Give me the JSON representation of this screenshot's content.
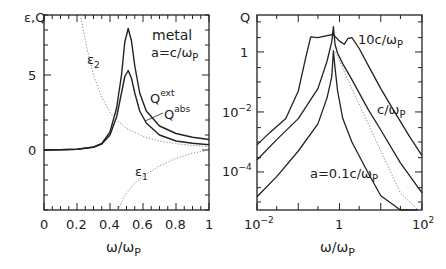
{
  "chart_data": [
    {
      "type": "line",
      "panel": "left",
      "ylabel": "ε,Q",
      "xlabel": "ω/ωP",
      "xlim": [
        0,
        1
      ],
      "ylim": [
        -4,
        9
      ],
      "xticks": [
        "0",
        "0.2",
        "0.4",
        "0.6",
        "0.8",
        "1"
      ],
      "yticks": [
        "0",
        "5"
      ],
      "annotations": [
        "metal",
        "a=c/ωP",
        "ε2",
        "ε1",
        "Qext",
        "Qabs"
      ],
      "series": [
        {
          "name": "Qext",
          "style": "solid",
          "x": [
            0,
            0.1,
            0.2,
            0.3,
            0.35,
            0.4,
            0.44,
            0.47,
            0.49,
            0.51,
            0.53,
            0.55,
            0.58,
            0.62,
            0.7,
            0.8,
            0.9,
            1.0
          ],
          "values": [
            0,
            0.01,
            0.05,
            0.2,
            0.45,
            1.2,
            2.8,
            5.0,
            7.2,
            8.1,
            7.3,
            5.6,
            3.8,
            2.6,
            1.6,
            1.1,
            0.85,
            0.7
          ]
        },
        {
          "name": "Qabs",
          "style": "solid",
          "x": [
            0,
            0.1,
            0.2,
            0.3,
            0.35,
            0.4,
            0.44,
            0.47,
            0.49,
            0.51,
            0.53,
            0.55,
            0.58,
            0.62,
            0.7,
            0.8,
            0.9,
            1.0
          ],
          "values": [
            0,
            0.01,
            0.05,
            0.18,
            0.4,
            1.0,
            2.2,
            3.8,
            4.9,
            5.3,
            4.8,
            3.8,
            2.6,
            1.8,
            1.0,
            0.6,
            0.45,
            0.35
          ]
        },
        {
          "name": "ε2",
          "style": "dotted",
          "x": [
            0.22,
            0.26,
            0.3,
            0.35,
            0.4,
            0.45,
            0.5,
            0.6,
            0.7,
            0.8,
            0.9,
            1.0
          ],
          "values": [
            9,
            6.8,
            5.0,
            3.5,
            2.5,
            1.9,
            1.45,
            0.9,
            0.6,
            0.42,
            0.3,
            0.22
          ]
        },
        {
          "name": "ε1",
          "style": "dotted",
          "x": [
            0.45,
            0.48,
            0.5,
            0.55,
            0.6,
            0.7,
            0.8,
            0.9,
            1.0
          ],
          "values": [
            -4,
            -3.2,
            -2.9,
            -2.2,
            -1.75,
            -1.05,
            -0.55,
            -0.22,
            0
          ]
        }
      ]
    },
    {
      "type": "line",
      "panel": "right",
      "ylabel": "Q",
      "xlabel": "ω/ωP",
      "xscale": "log",
      "yscale": "log",
      "xlim": [
        0.01,
        100
      ],
      "ylim": [
        5.4e-06,
        17
      ],
      "xticks": [
        "10^-2",
        "1",
        "10^2"
      ],
      "yticks": [
        "10^-4",
        "10^-2",
        "1"
      ],
      "annotations": [
        "10c/ωP",
        "c/ωP",
        "a=0.1c/ωP"
      ],
      "series": [
        {
          "name": "10c/ωP",
          "style": "solid",
          "x": [
            0.01,
            0.02,
            0.05,
            0.1,
            0.15,
            0.2,
            0.3,
            0.5,
            0.7,
            1.0,
            1.3,
            1.6,
            2.0,
            3,
            5,
            10,
            20,
            50,
            100
          ],
          "values": [
            0.0008,
            0.002,
            0.006,
            0.05,
            0.6,
            3.2,
            3.0,
            3.5,
            3.8,
            2.3,
            1.8,
            2.8,
            3.0,
            1.3,
            0.35,
            0.06,
            0.012,
            0.0015,
            0.00035
          ]
        },
        {
          "name": "c/ωP",
          "style": "solid",
          "x": [
            0.01,
            0.03,
            0.1,
            0.3,
            0.5,
            0.65,
            0.71,
            0.78,
            0.9,
            1.2,
            2,
            5,
            10,
            30,
            100
          ],
          "values": [
            0.00025,
            0.0012,
            0.006,
            0.06,
            0.5,
            2.2,
            7,
            1.8,
            0.9,
            0.4,
            0.12,
            0.012,
            0.0025,
            0.0002,
            2e-05
          ]
        },
        {
          "name": "a=0.1c/ωP",
          "style": "solid",
          "x": [
            0.01,
            0.03,
            0.1,
            0.3,
            0.5,
            0.65,
            0.71,
            0.78,
            0.9,
            1.2,
            2,
            5,
            10,
            30,
            80
          ],
          "values": [
            1.5e-05,
            7e-05,
            0.0005,
            0.004,
            0.03,
            0.15,
            1.1,
            0.3,
            0.05,
            0.006,
            0.001,
            9e-05,
            1.6e-05,
            1.5e-06,
            5.5e-06
          ]
        },
        {
          "name": "dotted",
          "style": "dotted",
          "x": [
            0.8,
            1,
            2,
            5,
            10,
            30,
            80
          ],
          "values": [
            1.0,
            0.5,
            0.06,
            0.004,
            0.0005,
            2e-05,
            5.5e-06
          ]
        }
      ]
    }
  ],
  "left": {
    "ylabel_text": "ε,Q",
    "xlabel_text": "ω/ω",
    "xlabel_sub": "P",
    "ytick_labels": [
      "5",
      "0"
    ],
    "xtick_labels": [
      "0",
      "0.2",
      "0.4",
      "0.6",
      "0.8",
      "1"
    ],
    "metal": "metal",
    "a_label": "a=c/ω",
    "a_sub": "P",
    "eps2": "ε",
    "eps2_sub": "2",
    "eps1": "ε",
    "eps1_sub": "1",
    "qext": "Q",
    "qext_sup": "ext",
    "qabs": "Q",
    "qabs_sup": "abs"
  },
  "right": {
    "ylabel_text": "Q",
    "xlabel_text": "ω/ω",
    "xlabel_sub": "P",
    "ytick_1": "1",
    "ytick_m2": "10",
    "ytick_m2_sup": "−2",
    "ytick_m4": "10",
    "ytick_m4_sup": "−4",
    "xtick_m2": "10",
    "xtick_m2_sup": "−2",
    "xtick_1": "1",
    "xtick_2": "10",
    "xtick_2_sup": "2",
    "lab_10c": "10c/ω",
    "lab_c": "c/ω",
    "lab_01c": "a=0.1c/ω",
    "lab_sub": "P"
  },
  "colors": {
    "axis": "#222222",
    "curve": "#222222",
    "dotted": "#888888"
  }
}
